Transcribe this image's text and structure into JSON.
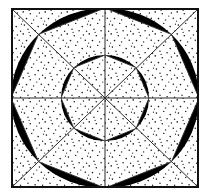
{
  "figure": {
    "title": "Eight-fold rosette in square frame",
    "background_color": "#ffffff",
    "ink_color": "#101010",
    "fill_color": "#000000",
    "stipple_color": "#1a1a1a",
    "line_color": "#2a2a2a"
  },
  "geometry": {
    "canvas": {
      "width": 210,
      "height": 196
    },
    "frame": {
      "name": "square-border",
      "x": 11,
      "y": 8,
      "width": 188,
      "height": 180,
      "stroke_width": 2.0
    },
    "center": {
      "x": 105,
      "y": 98
    },
    "outer_circle": {
      "name": "outer-circle",
      "cx": 105,
      "cy": 98,
      "rx": 94,
      "ry": 90,
      "stroke_width": 1.0
    },
    "inner_circle": {
      "name": "inner-circle",
      "cx": 105,
      "cy": 98,
      "rx": 44,
      "ry": 43,
      "stroke_width": 1.0
    },
    "outer_octagon": {
      "name": "outer-octagon",
      "vertex_count": 8,
      "rx": 94,
      "ry": 90,
      "start_angle_deg": 0
    },
    "inner_octagon": {
      "name": "inner-octagon",
      "vertex_count": 8,
      "rx": 44,
      "ry": 43,
      "start_angle_deg": 0
    },
    "petals": {
      "outer_count": 8,
      "inner_count": 8,
      "description": "Each petal is the circular segment between one octagon chord and the containing circular arc, filled solid black."
    },
    "diameters": [
      {
        "name": "horizontal-median",
        "angle_deg": 0
      },
      {
        "name": "diagonal-down-right",
        "angle_deg": 45
      },
      {
        "name": "vertical-median",
        "angle_deg": 90
      },
      {
        "name": "diagonal-up-right",
        "angle_deg": 135
      }
    ],
    "stipple": {
      "name": "stipple-texture",
      "dot_radius": 0.75,
      "tile_size": 11,
      "approx_density_per_100px2": 1.7
    }
  },
  "labels": {
    "caption": "",
    "annotations": []
  }
}
